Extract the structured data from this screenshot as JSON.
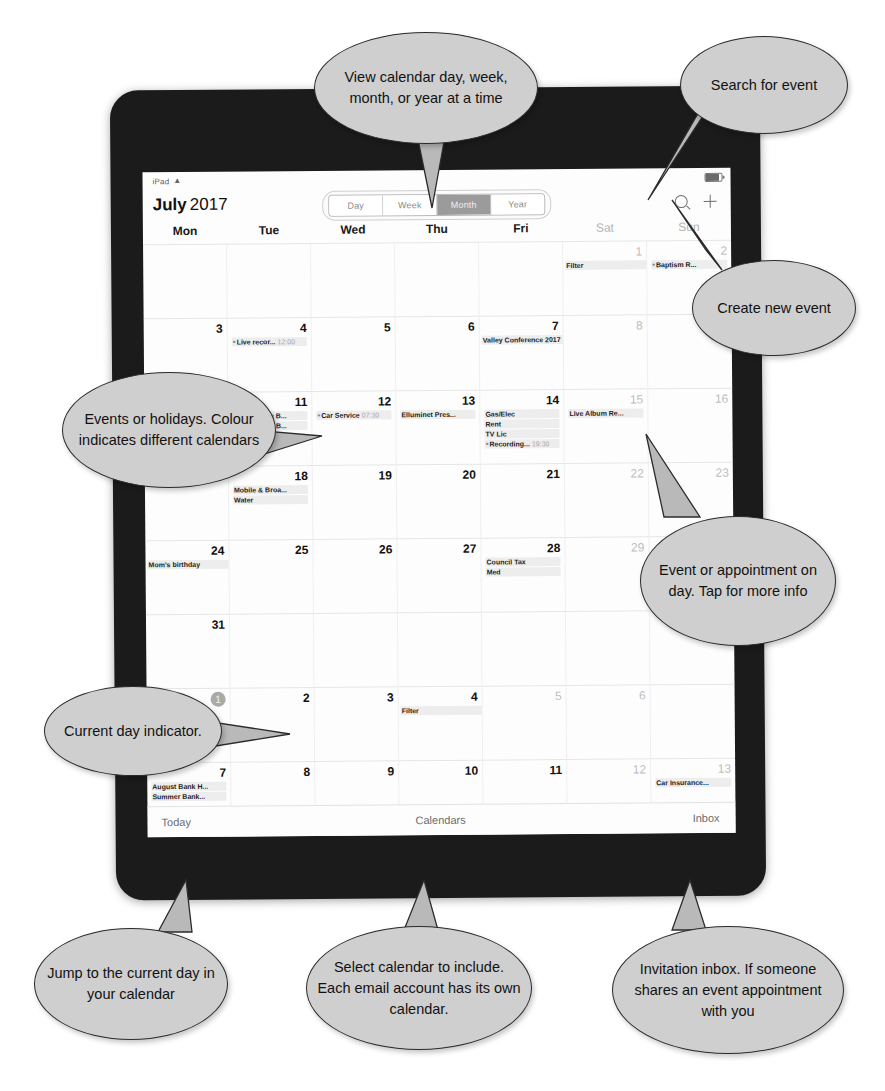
{
  "status_bar": {
    "device_label": "iPad",
    "wifi_icon": "wifi-icon",
    "battery_icon": "battery-icon"
  },
  "nav": {
    "month": "July",
    "year": "2017",
    "view_options": [
      "Day",
      "Week",
      "Month",
      "Year"
    ],
    "selected_view": "Month",
    "search_icon": "search-icon",
    "add_icon": "plus-icon"
  },
  "weekdays": [
    {
      "label": "Mon",
      "weekend": false
    },
    {
      "label": "Tue",
      "weekend": false
    },
    {
      "label": "Wed",
      "weekend": false
    },
    {
      "label": "Thu",
      "weekend": false
    },
    {
      "label": "Fri",
      "weekend": false
    },
    {
      "label": "Sat",
      "weekend": true
    },
    {
      "label": "Sun",
      "weekend": true
    }
  ],
  "days": [
    {
      "num": "",
      "dim": false,
      "events": []
    },
    {
      "num": "",
      "dim": false,
      "events": []
    },
    {
      "num": "",
      "dim": false,
      "events": []
    },
    {
      "num": "",
      "dim": false,
      "events": []
    },
    {
      "num": "",
      "dim": false,
      "events": []
    },
    {
      "num": "1",
      "dim": true,
      "events": [
        {
          "title": "Filter",
          "bullet": false,
          "time": "",
          "wide": true
        }
      ]
    },
    {
      "num": "2",
      "dim": true,
      "events": [
        {
          "title": "Baptism R...",
          "bullet": true,
          "time": "",
          "wide": false
        }
      ]
    },
    {
      "num": "3",
      "dim": false,
      "events": []
    },
    {
      "num": "4",
      "dim": false,
      "events": [
        {
          "title": "Live recor...",
          "bullet": true,
          "time": "12:00",
          "wide": false
        }
      ]
    },
    {
      "num": "5",
      "dim": false,
      "events": []
    },
    {
      "num": "6",
      "dim": false,
      "events": []
    },
    {
      "num": "7",
      "dim": false,
      "events": [
        {
          "title": "Valley Conference 2017",
          "bullet": false,
          "time": "",
          "wide": true
        }
      ]
    },
    {
      "num": "8",
      "dim": true,
      "events": []
    },
    {
      "num": "9",
      "dim": true,
      "events": []
    },
    {
      "num": "10",
      "dim": false,
      "events": []
    },
    {
      "num": "11",
      "dim": false,
      "events": [
        {
          "title": "Battle of the B...",
          "bullet": false,
          "time": "",
          "wide": false
        },
        {
          "title": "Battle of the B...",
          "bullet": false,
          "time": "",
          "wide": false
        }
      ]
    },
    {
      "num": "12",
      "dim": false,
      "events": [
        {
          "title": "Car Service",
          "bullet": true,
          "time": "07:30",
          "wide": false
        }
      ]
    },
    {
      "num": "13",
      "dim": false,
      "events": [
        {
          "title": "Elluminet Pres...",
          "bullet": false,
          "time": "",
          "wide": false
        }
      ]
    },
    {
      "num": "14",
      "dim": false,
      "events": [
        {
          "title": "Gas/Elec",
          "bullet": false,
          "time": "",
          "wide": false
        },
        {
          "title": "Rent",
          "bullet": false,
          "time": "",
          "wide": false
        },
        {
          "title": "TV Lic",
          "bullet": false,
          "time": "",
          "wide": false
        },
        {
          "title": "Recording...",
          "bullet": true,
          "time": "19:30",
          "wide": false
        }
      ]
    },
    {
      "num": "15",
      "dim": true,
      "events": [
        {
          "title": "Live Album Re...",
          "bullet": false,
          "time": "",
          "wide": false
        }
      ]
    },
    {
      "num": "16",
      "dim": true,
      "events": []
    },
    {
      "num": "17",
      "dim": false,
      "events": []
    },
    {
      "num": "18",
      "dim": false,
      "events": [
        {
          "title": "Mobile & Broa...",
          "bullet": false,
          "time": "",
          "wide": false
        },
        {
          "title": "Water",
          "bullet": false,
          "time": "",
          "wide": false
        }
      ]
    },
    {
      "num": "19",
      "dim": false,
      "events": []
    },
    {
      "num": "20",
      "dim": false,
      "events": []
    },
    {
      "num": "21",
      "dim": false,
      "events": []
    },
    {
      "num": "22",
      "dim": true,
      "events": []
    },
    {
      "num": "23",
      "dim": true,
      "events": []
    },
    {
      "num": "24",
      "dim": false,
      "events": [
        {
          "title": "Mom's birthday",
          "bullet": false,
          "time": "",
          "wide": true
        }
      ]
    },
    {
      "num": "25",
      "dim": false,
      "events": []
    },
    {
      "num": "26",
      "dim": false,
      "events": []
    },
    {
      "num": "27",
      "dim": false,
      "events": []
    },
    {
      "num": "28",
      "dim": false,
      "events": [
        {
          "title": "Council Tax",
          "bullet": false,
          "time": "",
          "wide": false
        },
        {
          "title": "Med",
          "bullet": false,
          "time": "",
          "wide": false
        }
      ]
    },
    {
      "num": "29",
      "dim": true,
      "events": []
    },
    {
      "num": "30",
      "dim": true,
      "events": []
    },
    {
      "num": "31",
      "dim": false,
      "events": []
    },
    {
      "num": "",
      "dim": false,
      "events": []
    },
    {
      "num": "",
      "dim": false,
      "events": []
    },
    {
      "num": "",
      "dim": false,
      "events": []
    },
    {
      "num": "",
      "dim": false,
      "events": []
    },
    {
      "num": "",
      "dim": false,
      "events": []
    },
    {
      "num": "",
      "dim": false,
      "events": []
    },
    {
      "num": "1",
      "dim": false,
      "month_label": "Aug",
      "today": true,
      "events": []
    },
    {
      "num": "2",
      "dim": false,
      "events": []
    },
    {
      "num": "3",
      "dim": false,
      "events": []
    },
    {
      "num": "4",
      "dim": false,
      "events": [
        {
          "title": "Filter",
          "bullet": false,
          "time": "",
          "wide": true
        }
      ]
    },
    {
      "num": "5",
      "dim": true,
      "events": []
    },
    {
      "num": "6",
      "dim": true,
      "events": []
    },
    {
      "num": "",
      "dim": false,
      "events": []
    },
    {
      "num": "7",
      "dim": false,
      "events": [
        {
          "title": "August Bank H...",
          "bullet": false,
          "time": "",
          "wide": false
        },
        {
          "title": "Summer Bank...",
          "bullet": false,
          "time": "",
          "wide": false
        }
      ]
    },
    {
      "num": "8",
      "dim": false,
      "events": []
    },
    {
      "num": "9",
      "dim": false,
      "events": []
    },
    {
      "num": "10",
      "dim": false,
      "events": []
    },
    {
      "num": "11",
      "dim": false,
      "events": []
    },
    {
      "num": "12",
      "dim": true,
      "events": []
    },
    {
      "num": "13",
      "dim": true,
      "events": [
        {
          "title": "Car Insurance...",
          "bullet": false,
          "time": "",
          "wide": false
        }
      ]
    }
  ],
  "toolbar": {
    "today_label": "Today",
    "calendars_label": "Calendars",
    "inbox_label": "Inbox"
  },
  "callouts": {
    "view_modes": "View calendar day, week, month, or year at a time",
    "search": "Search for event",
    "create_event": "Create new event",
    "events_colour": "Events or holidays. Colour indicates different calendars",
    "event_tap": "Event or appointment on day. Tap for more info",
    "current_day": "Current day indicator.",
    "jump_today": "Jump to the current day in your calendar",
    "select_calendar": "Select calendar to include. Each email account has its own calendar.",
    "invitation_inbox": "Invitation inbox. If someone shares an event appointment with you"
  }
}
